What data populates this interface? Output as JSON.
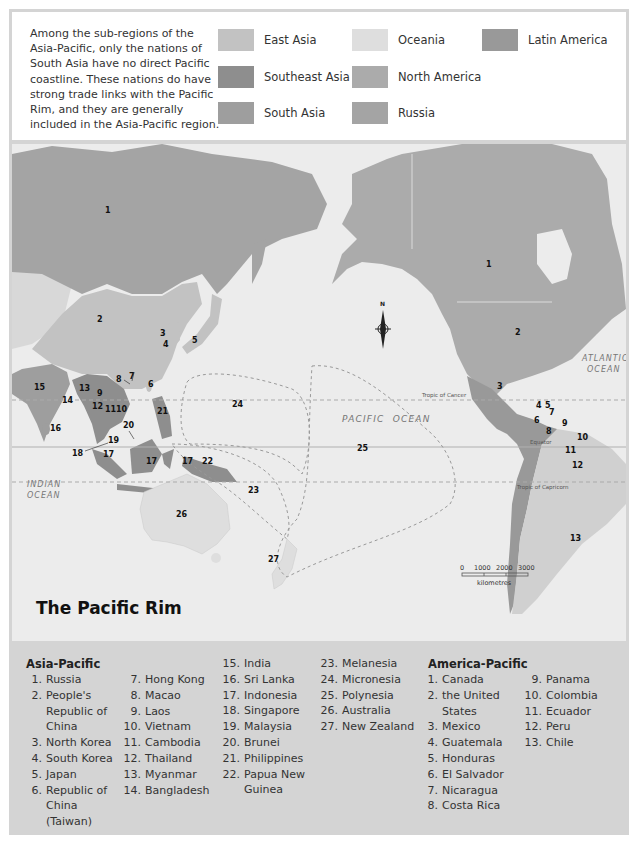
{
  "intro_text": "Among the sub-regions of the Asia-Pacific, only the nations of South Asia have no direct Pacific coastline. These nations do have strong trade links with the Pacific Rim, and they are generally included in the Asia-Pacific region.",
  "legend": [
    {
      "label": "East Asia",
      "color": "#c2c2c2"
    },
    {
      "label": "Southeast Asia",
      "color": "#8e8e8e"
    },
    {
      "label": "South Asia",
      "color": "#9e9e9e"
    },
    {
      "label": "Oceania",
      "color": "#dedede"
    },
    {
      "label": "North America",
      "color": "#ababab"
    },
    {
      "label": "Russia",
      "color": "#a4a4a4"
    },
    {
      "label": "Latin America",
      "color": "#999999"
    }
  ],
  "map": {
    "title": "The Pacific Rim",
    "ocean_labels": {
      "pacific": "PACIFIC  OCEAN",
      "atlantic_1": "ATLANTIC",
      "atlantic_2": "OCEAN",
      "indian_1": "INDIAN",
      "indian_2": "OCEAN"
    },
    "lines": {
      "tropic_cancer": "Tropic of Cancer",
      "equator": "Equator",
      "tropic_capricorn": "Tropic of Capricorn"
    },
    "compass": "N",
    "scale": {
      "ticks": [
        "0",
        "1000",
        "2000",
        "3000"
      ],
      "unit": "kilometres"
    },
    "asia_markers": [
      "1",
      "2",
      "3",
      "4",
      "5",
      "6",
      "7",
      "8",
      "9",
      "10",
      "11",
      "12",
      "13",
      "14",
      "15",
      "16",
      "17",
      "17",
      "17",
      "18",
      "19",
      "20",
      "21",
      "22",
      "23",
      "24",
      "25",
      "26",
      "27"
    ],
    "america_markers": [
      "1",
      "2",
      "3",
      "4",
      "5",
      "6",
      "7",
      "8",
      "9",
      "10",
      "11",
      "12",
      "13"
    ]
  },
  "asia_pacific": {
    "title": "Asia-Pacific",
    "items": [
      {
        "n": "1.",
        "t": "Russia"
      },
      {
        "n": "2.",
        "t": "People's Republic of China"
      },
      {
        "n": "3.",
        "t": "North Korea"
      },
      {
        "n": "4.",
        "t": "South Korea"
      },
      {
        "n": "5.",
        "t": "Japan"
      },
      {
        "n": "6.",
        "t": "Republic of China (Taiwan)"
      },
      {
        "n": "7.",
        "t": "Hong Kong"
      },
      {
        "n": "8.",
        "t": "Macao"
      },
      {
        "n": "9.",
        "t": "Laos"
      },
      {
        "n": "10.",
        "t": "Vietnam"
      },
      {
        "n": "11.",
        "t": "Cambodia"
      },
      {
        "n": "12.",
        "t": "Thailand"
      },
      {
        "n": "13.",
        "t": "Myanmar"
      },
      {
        "n": "14.",
        "t": "Bangladesh"
      },
      {
        "n": "15.",
        "t": "India"
      },
      {
        "n": "16.",
        "t": "Sri Lanka"
      },
      {
        "n": "17.",
        "t": "Indonesia"
      },
      {
        "n": "18.",
        "t": "Singapore"
      },
      {
        "n": "19.",
        "t": "Malaysia"
      },
      {
        "n": "20.",
        "t": "Brunei"
      },
      {
        "n": "21.",
        "t": "Philippines"
      },
      {
        "n": "22.",
        "t": "Papua New Guinea"
      },
      {
        "n": "23.",
        "t": "Melanesia"
      },
      {
        "n": "24.",
        "t": "Micronesia"
      },
      {
        "n": "25.",
        "t": "Polynesia"
      },
      {
        "n": "26.",
        "t": "Australia"
      },
      {
        "n": "27.",
        "t": "New Zealand"
      }
    ]
  },
  "america_pacific": {
    "title": "America-Pacific",
    "items": [
      {
        "n": "1.",
        "t": "Canada"
      },
      {
        "n": "2.",
        "t": "the United States"
      },
      {
        "n": "3.",
        "t": "Mexico"
      },
      {
        "n": "4.",
        "t": "Guatemala"
      },
      {
        "n": "5.",
        "t": "Honduras"
      },
      {
        "n": "6.",
        "t": "El Salvador"
      },
      {
        "n": "7.",
        "t": "Nicaragua"
      },
      {
        "n": "8.",
        "t": "Costa Rica"
      },
      {
        "n": "9.",
        "t": "Panama"
      },
      {
        "n": "10.",
        "t": "Colombia"
      },
      {
        "n": "11.",
        "t": "Ecuador"
      },
      {
        "n": "12.",
        "t": "Peru"
      },
      {
        "n": "13.",
        "t": "Chile"
      }
    ]
  }
}
